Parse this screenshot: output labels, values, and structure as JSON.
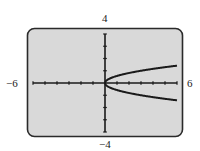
{
  "window": {
    "xmin_label": "−6",
    "xmax_label": "6",
    "ymax_label": "4",
    "ymin_label": "−4"
  },
  "colors": {
    "screen_bg": "#d9d9d9",
    "screen_border": "#2a2a2a",
    "axis": "#1a1a1a",
    "curve": "#1a1a1a"
  },
  "chart_data": {
    "type": "line",
    "title": "",
    "xlabel": "",
    "ylabel": "",
    "xlim": [
      -6,
      6
    ],
    "ylim": [
      -4,
      4
    ],
    "xscale": 1,
    "yscale": 1,
    "grid": false,
    "legend": null,
    "series": [
      {
        "name": "y = sqrt(x/3)",
        "x": [
          0,
          0.5,
          1,
          1.5,
          2,
          2.5,
          3,
          3.5,
          4,
          4.5,
          5,
          5.5,
          6
        ],
        "values": [
          0,
          0.41,
          0.58,
          0.71,
          0.82,
          0.91,
          1.0,
          1.08,
          1.15,
          1.22,
          1.29,
          1.35,
          1.41
        ]
      },
      {
        "name": "y = -sqrt(x/3)",
        "x": [
          0,
          0.5,
          1,
          1.5,
          2,
          2.5,
          3,
          3.5,
          4,
          4.5,
          5,
          5.5,
          6
        ],
        "values": [
          0,
          -0.41,
          -0.58,
          -0.71,
          -0.82,
          -0.91,
          -1.0,
          -1.08,
          -1.15,
          -1.22,
          -1.29,
          -1.35,
          -1.41
        ]
      }
    ],
    "annotations": [
      "-6",
      "6",
      "4",
      "-4"
    ]
  }
}
